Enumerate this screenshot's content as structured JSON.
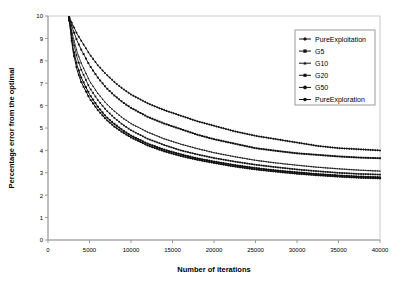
{
  "chart_data": {
    "type": "line",
    "title": "",
    "xlabel": "Number of iterations",
    "ylabel": "Percentage error from the optimal",
    "xlim": [
      0,
      40000
    ],
    "ylim": [
      0,
      10
    ],
    "xticks": [
      0,
      5000,
      10000,
      15000,
      20000,
      25000,
      30000,
      35000,
      40000
    ],
    "xtick_labels": [
      "0",
      "5000",
      "10000",
      "15000",
      "20000",
      "25000",
      "30000",
      "35000",
      "40000"
    ],
    "yticks": [
      0,
      1,
      2,
      3,
      4,
      5,
      6,
      7,
      8,
      9,
      10
    ],
    "ytick_labels": [
      "0",
      "1",
      "2",
      "3",
      "4",
      "5",
      "6",
      "7",
      "8",
      "9",
      "10"
    ],
    "grid": false,
    "legend_position": "upper right",
    "x": [
      2500,
      3000,
      3500,
      4000,
      5000,
      6000,
      7000,
      8000,
      9000,
      10000,
      12000,
      14000,
      16000,
      18000,
      20000,
      22500,
      25000,
      27500,
      30000,
      32500,
      35000,
      37500,
      40000
    ],
    "series": [
      {
        "name": "PureExploitation",
        "marker": "diamond",
        "values": [
          10.0,
          9.6,
          9.2,
          8.9,
          8.3,
          7.8,
          7.4,
          7.05,
          6.75,
          6.5,
          6.1,
          5.8,
          5.55,
          5.3,
          5.1,
          4.85,
          4.65,
          4.5,
          4.35,
          4.2,
          4.1,
          4.05,
          4.0
        ]
      },
      {
        "name": "G5",
        "marker": "square",
        "values": [
          10.0,
          9.4,
          8.9,
          8.5,
          7.8,
          7.25,
          6.8,
          6.45,
          6.15,
          5.9,
          5.5,
          5.2,
          4.95,
          4.7,
          4.5,
          4.3,
          4.1,
          3.98,
          3.87,
          3.8,
          3.73,
          3.68,
          3.65
        ]
      },
      {
        "name": "G10",
        "marker": "triangle",
        "values": [
          10.0,
          9.1,
          8.4,
          7.9,
          7.1,
          6.55,
          6.1,
          5.75,
          5.45,
          5.2,
          4.82,
          4.52,
          4.28,
          4.08,
          3.9,
          3.72,
          3.56,
          3.44,
          3.34,
          3.25,
          3.18,
          3.12,
          3.08
        ]
      },
      {
        "name": "G20",
        "marker": "cross",
        "values": [
          10.0,
          8.9,
          8.15,
          7.6,
          6.8,
          6.25,
          5.8,
          5.45,
          5.15,
          4.9,
          4.52,
          4.24,
          4.0,
          3.82,
          3.66,
          3.5,
          3.36,
          3.25,
          3.15,
          3.07,
          3.0,
          2.95,
          2.92
        ]
      },
      {
        "name": "G50",
        "marker": "star",
        "values": [
          10.0,
          8.6,
          7.8,
          7.25,
          6.5,
          5.95,
          5.5,
          5.18,
          4.9,
          4.66,
          4.3,
          4.03,
          3.82,
          3.64,
          3.5,
          3.34,
          3.21,
          3.1,
          3.02,
          2.94,
          2.88,
          2.83,
          2.8
        ]
      },
      {
        "name": "PureExploration",
        "marker": "circle",
        "values": [
          10.0,
          8.45,
          7.6,
          7.05,
          6.32,
          5.8,
          5.38,
          5.06,
          4.8,
          4.58,
          4.22,
          3.96,
          3.75,
          3.58,
          3.44,
          3.28,
          3.15,
          3.05,
          2.96,
          2.89,
          2.83,
          2.78,
          2.75
        ]
      }
    ]
  },
  "legend": {
    "items": [
      "PureExploitation",
      "G5",
      "G10",
      "G20",
      "G50",
      "PureExploration"
    ]
  },
  "colors": {
    "series": "#111111",
    "axis": "#9a9a9a",
    "background": "#ffffff"
  }
}
